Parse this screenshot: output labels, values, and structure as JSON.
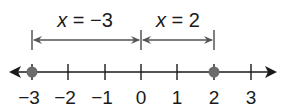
{
  "diagram": {
    "type": "number-line",
    "tick_values": [
      -3,
      -2,
      -1,
      0,
      1,
      2,
      3
    ],
    "tick_labels": [
      "−3",
      "−2",
      "−1",
      "0",
      "1",
      "2",
      "3"
    ],
    "points": [
      {
        "value": -3,
        "label": "−3"
      },
      {
        "value": 2,
        "label": "2"
      }
    ],
    "brackets": [
      {
        "from": -3,
        "to": 0,
        "label_var": "x",
        "label_rest": " = −3"
      },
      {
        "from": 0,
        "to": 2,
        "label_var": "x",
        "label_rest": " = 2"
      }
    ],
    "colors": {
      "line": "#1a1a1a",
      "point": "#6b6b6b",
      "bracket": "#555555"
    }
  }
}
